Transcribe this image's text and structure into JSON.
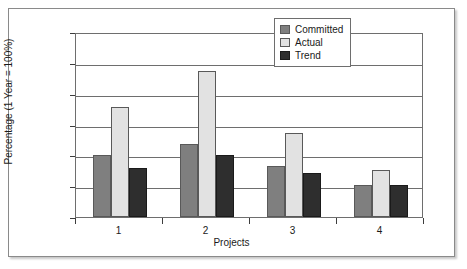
{
  "chart_data": {
    "type": "bar",
    "title": "",
    "xlabel": "Projects",
    "ylabel": "Percentage (1 Year = 100%)",
    "categories": [
      "1",
      "2",
      "3",
      "4"
    ],
    "series": [
      {
        "name": "Committed",
        "color": "#7f7f7f",
        "values": [
          100,
          119,
          82,
          52
        ]
      },
      {
        "name": "Actual",
        "color": "#e2e2e2",
        "values": [
          178,
          237,
          137,
          77
        ]
      },
      {
        "name": "Trend",
        "color": "#2e2e2e",
        "values": [
          80,
          101,
          72,
          52
        ]
      }
    ],
    "ylim": [
      0,
      300
    ],
    "yticks": [
      0,
      50,
      100,
      150,
      200,
      250,
      300
    ],
    "ytick_labels": [
      "0",
      "50",
      "100",
      "150",
      "200",
      "250",
      "300"
    ],
    "grid": true,
    "legend_position": "top-right"
  },
  "figure": {
    "border_color": "#8a8a8a",
    "background": "#ffffff",
    "axis_color": "#6e6e6e"
  }
}
